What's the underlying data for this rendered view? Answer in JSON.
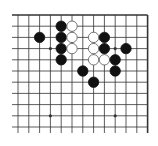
{
  "board": {
    "description": "Go board fragment (top portion, right edge visible)",
    "columns": 13,
    "rows": 11,
    "top_edge": true,
    "right_edge": true,
    "left_edge": false,
    "bottom_edge": false,
    "colors": {
      "background": "#ffffff",
      "line": "#333333",
      "black_stone": "#111111",
      "white_stone": "#ffffff",
      "white_stone_outline": "#555555"
    },
    "star_points": [
      [
        3,
        3
      ],
      [
        9,
        3
      ],
      [
        3,
        9
      ],
      [
        9,
        9
      ]
    ],
    "stones": [
      {
        "color": "black",
        "col": 2,
        "row": 2
      },
      {
        "color": "black",
        "col": 4,
        "row": 1
      },
      {
        "color": "black",
        "col": 4,
        "row": 2
      },
      {
        "color": "black",
        "col": 4,
        "row": 3
      },
      {
        "color": "black",
        "col": 4,
        "row": 4
      },
      {
        "color": "white",
        "col": 5,
        "row": 1
      },
      {
        "color": "white",
        "col": 5,
        "row": 2
      },
      {
        "color": "white",
        "col": 5,
        "row": 3
      },
      {
        "color": "white",
        "col": 7,
        "row": 2
      },
      {
        "color": "white",
        "col": 7,
        "row": 3
      },
      {
        "color": "white",
        "col": 7,
        "row": 4
      },
      {
        "color": "black",
        "col": 8,
        "row": 2
      },
      {
        "color": "black",
        "col": 8,
        "row": 3
      },
      {
        "color": "white",
        "col": 8,
        "row": 4
      },
      {
        "color": "black",
        "col": 10,
        "row": 3
      },
      {
        "color": "black",
        "col": 9,
        "row": 4
      },
      {
        "color": "black",
        "col": 9,
        "row": 5
      },
      {
        "color": "black",
        "col": 6,
        "row": 5
      },
      {
        "color": "black",
        "col": 7,
        "row": 6
      }
    ]
  }
}
